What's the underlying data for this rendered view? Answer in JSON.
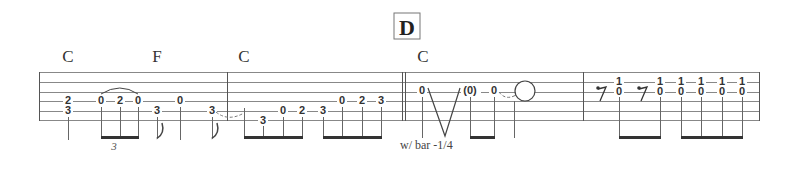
{
  "rehearsal_mark": "D",
  "chords": [
    {
      "label": "C",
      "x": 68
    },
    {
      "label": "F",
      "x": 157
    },
    {
      "label": "C",
      "x": 244
    },
    {
      "label": "C",
      "x": 423
    }
  ],
  "annotations": {
    "triplet": "3",
    "whammy": "w/ bar -1/4",
    "ghost_note": "(0)"
  },
  "measures": [
    {
      "notes": [
        {
          "x": 68,
          "frets": [
            {
              "string": 3,
              "fret": "2"
            },
            {
              "string": 4,
              "fret": "3"
            }
          ]
        },
        {
          "x": 101,
          "frets": [
            {
              "string": 3,
              "fret": "0"
            }
          ]
        },
        {
          "x": 120,
          "frets": [
            {
              "string": 3,
              "fret": "2"
            }
          ]
        },
        {
          "x": 138,
          "frets": [
            {
              "string": 3,
              "fret": "0"
            }
          ]
        },
        {
          "x": 157,
          "frets": [
            {
              "string": 4,
              "fret": "3"
            }
          ]
        },
        {
          "x": 180,
          "frets": [
            {
              "string": 3,
              "fret": "0"
            }
          ]
        },
        {
          "x": 212,
          "frets": [
            {
              "string": 4,
              "fret": "3"
            }
          ]
        }
      ]
    },
    {
      "notes": [
        {
          "x": 263,
          "frets": [
            {
              "string": 5,
              "fret": "3"
            }
          ]
        },
        {
          "x": 283,
          "frets": [
            {
              "string": 4,
              "fret": "0"
            }
          ]
        },
        {
          "x": 302,
          "frets": [
            {
              "string": 4,
              "fret": "2"
            }
          ]
        },
        {
          "x": 323,
          "frets": [
            {
              "string": 4,
              "fret": "3"
            }
          ]
        },
        {
          "x": 342,
          "frets": [
            {
              "string": 3,
              "fret": "0"
            }
          ]
        },
        {
          "x": 362,
          "frets": [
            {
              "string": 3,
              "fret": "2"
            }
          ]
        },
        {
          "x": 381,
          "frets": [
            {
              "string": 3,
              "fret": "3"
            }
          ]
        }
      ]
    },
    {
      "notes": [
        {
          "x": 422,
          "frets": [
            {
              "string": 2,
              "fret": "0"
            }
          ]
        },
        {
          "x": 470,
          "frets": [
            {
              "string": 2,
              "fret": "(0)"
            }
          ]
        },
        {
          "x": 494,
          "frets": [
            {
              "string": 2,
              "fret": "0"
            }
          ]
        }
      ]
    },
    {
      "notes": [
        {
          "x": 619,
          "frets": [
            {
              "string": 1,
              "fret": "1"
            },
            {
              "string": 2,
              "fret": "0"
            }
          ]
        },
        {
          "x": 660,
          "frets": [
            {
              "string": 1,
              "fret": "1"
            },
            {
              "string": 2,
              "fret": "0"
            }
          ]
        },
        {
          "x": 681,
          "frets": [
            {
              "string": 1,
              "fret": "1"
            },
            {
              "string": 2,
              "fret": "0"
            }
          ]
        },
        {
          "x": 701,
          "frets": [
            {
              "string": 1,
              "fret": "1"
            },
            {
              "string": 2,
              "fret": "0"
            }
          ]
        },
        {
          "x": 722,
          "frets": [
            {
              "string": 1,
              "fret": "1"
            },
            {
              "string": 2,
              "fret": "0"
            }
          ]
        },
        {
          "x": 742,
          "frets": [
            {
              "string": 1,
              "fret": "1"
            },
            {
              "string": 2,
              "fret": "0"
            }
          ]
        }
      ]
    }
  ]
}
